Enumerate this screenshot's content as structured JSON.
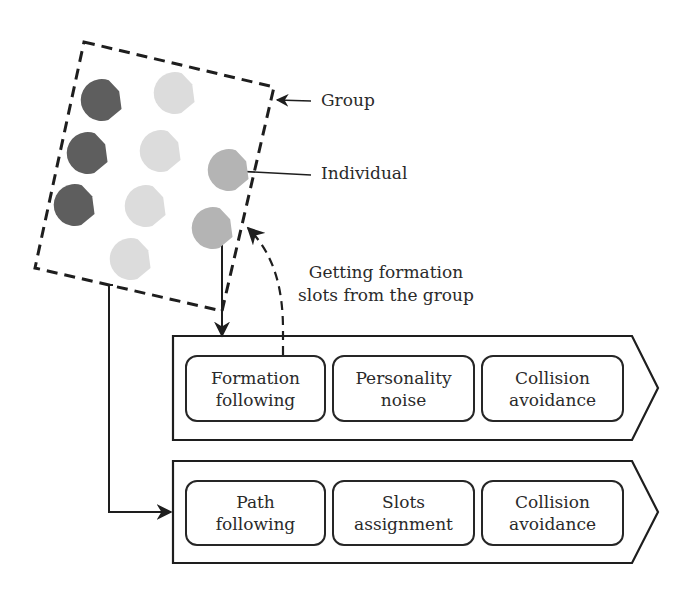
{
  "diagram": {
    "labels": {
      "group": "Group",
      "individual": "Individual",
      "getting_slots_line1": "Getting formation",
      "getting_slots_line2": "slots from the group"
    },
    "agents": {
      "colors": {
        "dark": "#5e5e5e",
        "mid": "#b4b4b4",
        "light": "#dcdcdc"
      },
      "items": [
        {
          "shade": "dark",
          "x": 101,
          "y": 100
        },
        {
          "shade": "dark",
          "x": 87,
          "y": 153
        },
        {
          "shade": "dark",
          "x": 74,
          "y": 205
        },
        {
          "shade": "light",
          "x": 174,
          "y": 93
        },
        {
          "shade": "light",
          "x": 160,
          "y": 151
        },
        {
          "shade": "light",
          "x": 145,
          "y": 206
        },
        {
          "shade": "light",
          "x": 130,
          "y": 259
        },
        {
          "shade": "mid",
          "x": 228,
          "y": 170
        },
        {
          "shade": "mid",
          "x": 212,
          "y": 228
        }
      ]
    },
    "individual_pipeline": {
      "modules": [
        {
          "line1": "Formation",
          "line2": "following"
        },
        {
          "line1": "Personality",
          "line2": "noise"
        },
        {
          "line1": "Collision",
          "line2": "avoidance"
        }
      ]
    },
    "group_pipeline": {
      "modules": [
        {
          "line1": "Path",
          "line2": "following"
        },
        {
          "line1": "Slots",
          "line2": "assignment"
        },
        {
          "line1": "Collision",
          "line2": "avoidance"
        }
      ]
    }
  }
}
